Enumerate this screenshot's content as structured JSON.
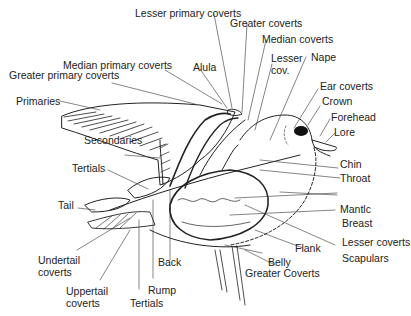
{
  "diagram": {
    "labels": {
      "lesser_primary_coverts": "Lesser primary coverts",
      "greater_coverts": "Greater coverts",
      "median_coverts": "Median coverts",
      "lesser_cov_1": "Lesser",
      "lesser_cov_2": "cov.",
      "nape": "Nape",
      "alula": "Alula",
      "median_primary_coverts": "Median primary coverts",
      "greater_primary_coverts": "Greater primary coverts",
      "ear_coverts": "Ear coverts",
      "crown": "Crown",
      "forehead": "Forehead",
      "lore": "Lore",
      "primaries": "Primaries",
      "secondaries": "Secondaries",
      "chin": "Chin",
      "throat": "Throat",
      "tertials_upper": "Tertials",
      "tail": "Tail",
      "mantle": "Mantlc",
      "breast": "Breast",
      "lesser_coverts": "Lesser coverts",
      "flank": "Flank",
      "scapulars": "Scapulars",
      "undertail_coverts_1": "Undertail",
      "undertail_coverts_2": "coverts",
      "back": "Back",
      "belly": "Belly",
      "greater_coverts_lower": "Greater Coverts",
      "uppertail_coverts_1": "Uppertail",
      "uppertail_coverts_2": "coverts",
      "rump": "Rump",
      "tertials_lower": "Tertials"
    }
  }
}
